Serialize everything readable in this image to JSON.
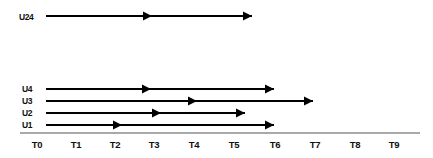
{
  "diagram": {
    "title_text": "",
    "type": "timeline-arrow-diagram",
    "colors": {
      "line": "#000000",
      "axis": "#8d8d8d",
      "text": "#111111",
      "background": "#ffffff"
    },
    "axis": {
      "name": "time-axis",
      "ticks": [
        {
          "label": "T0",
          "x": 37
        },
        {
          "label": "T1",
          "x": 76
        },
        {
          "label": "T2",
          "x": 115
        },
        {
          "label": "T3",
          "x": 154
        },
        {
          "label": "T4",
          "x": 194
        },
        {
          "label": "T5",
          "x": 234
        },
        {
          "label": "T6",
          "x": 275
        },
        {
          "label": "T7",
          "x": 315
        },
        {
          "label": "T8",
          "x": 355
        },
        {
          "label": "T9",
          "x": 394
        }
      ],
      "line_start_x": 20,
      "line_end_x": 420,
      "line_y": 133,
      "label_y": 148
    },
    "tracks": [
      {
        "label": "U24",
        "label_x": 19,
        "label_y": 20,
        "y": 16,
        "start_x": 46,
        "end_x": 252,
        "mid_arrow_x": 152
      },
      {
        "label": "U4",
        "label_x": 22,
        "label_y": 92,
        "y": 89,
        "start_x": 46,
        "end_x": 274,
        "mid_arrow_x": 151
      },
      {
        "label": "U3",
        "label_x": 22,
        "label_y": 104,
        "y": 101,
        "start_x": 46,
        "end_x": 313,
        "mid_arrow_x": 197
      },
      {
        "label": "U2",
        "label_x": 22,
        "label_y": 116,
        "y": 113,
        "start_x": 46,
        "end_x": 245,
        "mid_arrow_x": 161
      },
      {
        "label": "U1",
        "label_x": 22,
        "label_y": 128,
        "y": 125,
        "start_x": 46,
        "end_x": 274,
        "mid_arrow_x": 122
      }
    ]
  }
}
